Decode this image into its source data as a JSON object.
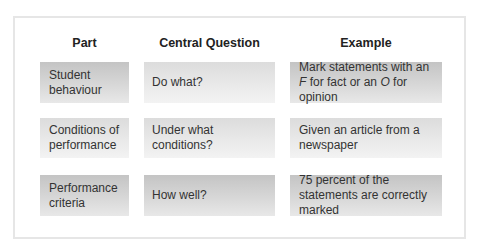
{
  "headers": [
    "Part",
    "Central Question",
    "Example"
  ],
  "rows": [
    {
      "part": "Student behaviour",
      "question": "Do what?",
      "example_pre": "Mark statements with an ",
      "example_f": "F",
      "example_mid": " for fact or an ",
      "example_o": "O",
      "example_post": " for opinion"
    },
    {
      "part": "Conditions of performance",
      "question": "Under what conditions?",
      "example": "Given an article from a newspaper"
    },
    {
      "part": "Performance criteria",
      "question": "How well?",
      "example": "75 percent of the statements are correctly marked"
    }
  ]
}
